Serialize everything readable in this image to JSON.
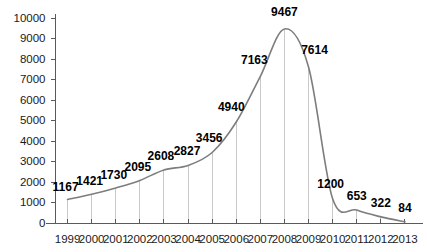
{
  "chart_data": {
    "type": "line",
    "title": "",
    "subtitle": "",
    "xlabel": "",
    "ylabel": "",
    "categories": [
      "1999",
      "2000",
      "2001",
      "2002",
      "2003",
      "2004",
      "2005",
      "2006",
      "2007",
      "2008",
      "2009",
      "2010",
      "2011",
      "2012",
      "2013"
    ],
    "values": [
      1167,
      1421,
      1730,
      2095,
      2608,
      2827,
      3456,
      4940,
      7163,
      9467,
      7614,
      1200,
      653,
      322,
      84
    ],
    "point_labels": [
      "1167",
      "1421",
      "1730",
      "2095",
      "2608",
      "2827",
      "3456",
      "4940",
      "7163",
      "9467",
      "7614",
      "1200",
      "653",
      "322",
      "84"
    ],
    "ylim": [
      0,
      10000
    ],
    "ytick_values": [
      0,
      1000,
      2000,
      3000,
      4000,
      5000,
      6000,
      7000,
      8000,
      9000,
      10000
    ],
    "ytick_labels": [
      "0",
      "1000",
      "2000",
      "3000",
      "4000",
      "5000",
      "6000",
      "7000",
      "8000",
      "9000",
      "10000"
    ],
    "grid": false,
    "droplines": true,
    "legend": null,
    "legend_position": "none",
    "series": [
      {
        "name": "",
        "values": [
          1167,
          1421,
          1730,
          2095,
          2608,
          2827,
          3456,
          4940,
          7163,
          9467,
          7614,
          1200,
          653,
          322,
          84
        ]
      }
    ],
    "colors": {
      "line": "#7d7d7d",
      "dropline": "#c9c9c9",
      "axis": "#5a5a5a",
      "label_text": "#000000",
      "tick_text": "#1a1a1a",
      "background": "#ffffff"
    }
  }
}
